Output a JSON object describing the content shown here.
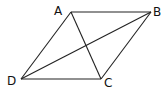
{
  "figure": {
    "shape": "parallelogram",
    "vertices": {
      "A": {
        "label": "A",
        "x": 71,
        "y": 12,
        "lx": 54,
        "ly": 15
      },
      "B": {
        "label": "B",
        "x": 151,
        "y": 12,
        "lx": 153,
        "ly": 16
      },
      "C": {
        "label": "C",
        "x": 101,
        "y": 79,
        "lx": 104,
        "ly": 87
      },
      "D": {
        "label": "D",
        "x": 21,
        "y": 79,
        "lx": 7,
        "ly": 85
      }
    },
    "edges": [
      [
        "A",
        "B"
      ],
      [
        "B",
        "C"
      ],
      [
        "C",
        "D"
      ],
      [
        "D",
        "A"
      ]
    ],
    "diagonals": [
      [
        "A",
        "C"
      ],
      [
        "B",
        "D"
      ]
    ],
    "colors": {
      "stroke": "#222222",
      "label": "#111111",
      "background": "#ffffff"
    }
  }
}
